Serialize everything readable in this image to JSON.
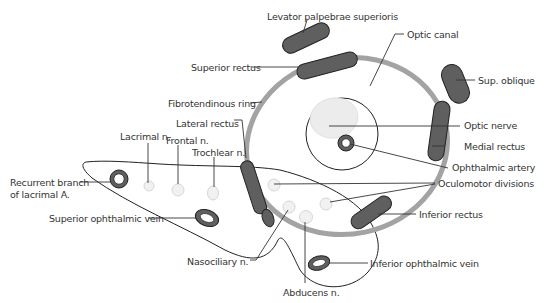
{
  "diagram": {
    "colors": {
      "muscle_fill": "#5f5f5f",
      "muscle_stroke": "#222222",
      "ring": "#a3a3a3",
      "nerve_fill": "#ececec",
      "outline": "#222222",
      "label_text": "#333333",
      "leader_line": "#333333"
    },
    "labels": {
      "levator": "Levator palpebrae superioris",
      "optic_canal": "Optic canal",
      "superior_rectus": "Superior rectus",
      "sup_oblique": "Sup. oblique",
      "fibrotendinous_ring": "Fibrotendinous ring",
      "lateral_rectus": "Lateral rectus",
      "optic_nerve": "Optic nerve",
      "lacrimal_n": "Lacrimal n.",
      "frontal_n": "Frontal n.",
      "medial_rectus": "Medial rectus",
      "trochlear_n": "Trochlear n.",
      "ophthalmic_artery": "Ophthalmic artery",
      "recurrent_branch_line1": "Recurrent branch",
      "recurrent_branch_line2": "of lacrimal A.",
      "oculomotor_divisions": "Oculomotor divisions",
      "superior_ophthalmic_vein": "Superior ophthalmic vein",
      "inferior_rectus": "Inferior rectus",
      "nasociliary_n": "Nasociliary n.",
      "inferior_ophthalmic_vein": "Inferior ophthalmic vein",
      "abducens_n": "Abducens n."
    }
  }
}
